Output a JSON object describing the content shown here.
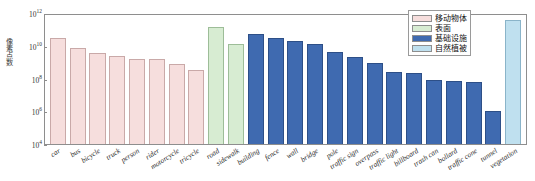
{
  "chart_data": {
    "type": "bar",
    "title": "",
    "xlabel": "",
    "ylabel": "像素点数",
    "yscale": "log",
    "ylim": [
      10000,
      1000000000000
    ],
    "ytick_labels": [
      "10¹²",
      "10¹⁰",
      "10⁸",
      "10⁶",
      "10⁴"
    ],
    "ytick_bases": [
      "10",
      "10",
      "10",
      "10",
      "10"
    ],
    "ytick_exps": [
      "12",
      "10",
      "8",
      "6",
      "4"
    ],
    "ytick_values": [
      1000000000000,
      10000000000,
      100000000,
      1000000,
      10000
    ],
    "grid": false,
    "legend_position": "top-right",
    "legend": [
      {
        "label": "移动物体",
        "color": "#f6dedd",
        "key": "moving"
      },
      {
        "label": "表面",
        "color": "#d7ecd2",
        "key": "surface"
      },
      {
        "label": "基础设施",
        "color": "#3f6ab0",
        "key": "infra"
      },
      {
        "label": "自然植被",
        "color": "#bfe0ef",
        "key": "vegetation"
      }
    ],
    "categories": [
      "car",
      "bus",
      "bicycle",
      "truck",
      "person",
      "rider",
      "motorcycle",
      "tricycle",
      "road",
      "sidewalk",
      "building",
      "fence",
      "wall",
      "bridge",
      "pole",
      "traffic sign",
      "overpass",
      "traffic light",
      "billboard",
      "trash can",
      "bollard",
      "traffic cone",
      "tunnel",
      "vegetation"
    ],
    "values": [
      30000000000.0,
      7500000000.0,
      3500000000.0,
      2500000000.0,
      1600000000.0,
      1500000000.0,
      800000000.0,
      350000000.0,
      150000000000.0,
      12000000000.0,
      50000000000.0,
      30000000000.0,
      20000000000.0,
      13000000000.0,
      4000000000.0,
      2000000000.0,
      900000000.0,
      250000000.0,
      230000000.0,
      80000000.0,
      70000000.0,
      65000000.0,
      1000000.0,
      400000000000.0
    ],
    "groups": [
      "moving",
      "moving",
      "moving",
      "moving",
      "moving",
      "moving",
      "moving",
      "moving",
      "surface",
      "surface",
      "infra",
      "infra",
      "infra",
      "infra",
      "infra",
      "infra",
      "infra",
      "infra",
      "infra",
      "infra",
      "infra",
      "infra",
      "infra",
      "vegetation"
    ]
  }
}
